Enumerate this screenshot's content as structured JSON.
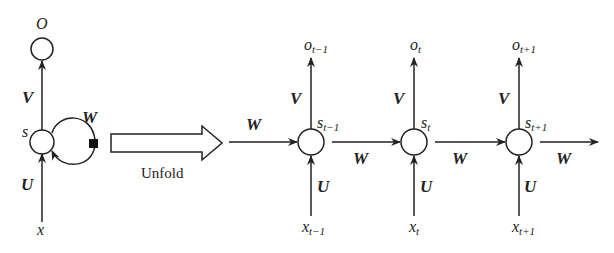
{
  "diagram": {
    "colors": {
      "stroke": "#222222",
      "background": "#ffffff"
    },
    "folded": {
      "output_label": "O",
      "state_label": "s",
      "input_label": "x",
      "weights": {
        "input": "U",
        "output": "V",
        "recurrent": "W"
      }
    },
    "unfold_label": "Unfold",
    "unfolded": {
      "incoming_weight": "W",
      "steps": [
        {
          "output": "o",
          "output_sub": "t−1",
          "state": "s",
          "state_sub": "t−1",
          "input": "x",
          "input_sub": "t−1",
          "V": "V",
          "U": "U",
          "W_out": "W"
        },
        {
          "output": "o",
          "output_sub": "t",
          "state": "s",
          "state_sub": "t",
          "input": "x",
          "input_sub": "t",
          "V": "V",
          "U": "U",
          "W_out": "W"
        },
        {
          "output": "o",
          "output_sub": "t+1",
          "state": "s",
          "state_sub": "t+1",
          "input": "x",
          "input_sub": "t+1",
          "V": "V",
          "U": "U",
          "W_out": "W"
        }
      ]
    }
  }
}
